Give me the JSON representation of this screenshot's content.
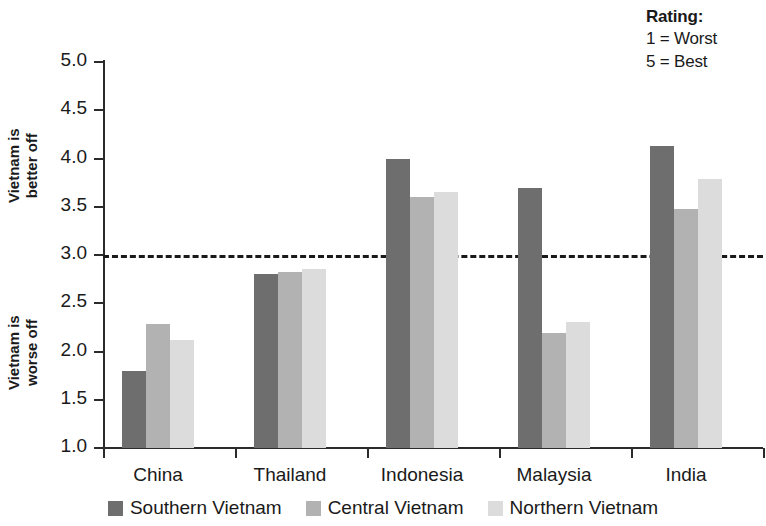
{
  "chart_data": {
    "type": "bar",
    "title": "",
    "subtitle": "",
    "xlabel": "",
    "ylabel": "",
    "categories": [
      "China",
      "Thailand",
      "Indonesia",
      "Malaysia",
      "India"
    ],
    "series": [
      {
        "name": "Southern Vietnam",
        "color": "#6e6e6e",
        "values": [
          1.8,
          2.8,
          4.0,
          3.69,
          4.13
        ]
      },
      {
        "name": "Central Vietnam",
        "color": "#b2b2b2",
        "values": [
          2.28,
          2.82,
          3.6,
          2.19,
          3.48
        ]
      },
      {
        "name": "Northern Vietnam",
        "color": "#dcdcdc",
        "values": [
          2.12,
          2.85,
          3.65,
          2.31,
          3.79
        ]
      }
    ],
    "ylim": [
      1.0,
      5.0
    ],
    "ytick_values": [
      1.0,
      1.5,
      2.0,
      2.5,
      3.0,
      3.5,
      4.0,
      4.5,
      5.0
    ],
    "ytick_labels": [
      "1.0",
      "1.5",
      "2.0",
      "2.5",
      "3.0",
      "3.5",
      "4.0",
      "4.5",
      "5.0"
    ],
    "grid": false,
    "legend_position": "bottom",
    "reference_line": {
      "value": 3.0,
      "style": "dashed",
      "color": "#1a1a1a"
    },
    "axis_annotations": {
      "upper": {
        "line1": "Vietnam is",
        "line2": "better off"
      },
      "lower": {
        "line1": "Vietnam is",
        "line2": "worse off"
      }
    },
    "note": {
      "title": "Rating:",
      "lines": [
        "1 = Worst",
        "5 = Best"
      ]
    }
  }
}
